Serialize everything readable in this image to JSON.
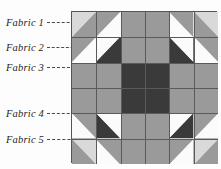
{
  "figure": {
    "kind": "quilt-block-diagram"
  },
  "labels": [
    {
      "id": "fabric-1",
      "text": "Fabric 1",
      "x": 6,
      "y": 17,
      "leader_x": 47,
      "leader_y": 22,
      "leader_w": 52
    },
    {
      "id": "fabric-2",
      "text": "Fabric 2",
      "x": 6,
      "y": 42,
      "leader_x": 47,
      "leader_y": 47,
      "leader_w": 36
    },
    {
      "id": "fabric-3",
      "text": "Fabric 3",
      "x": 6,
      "y": 62,
      "leader_x": 47,
      "leader_y": 67,
      "leader_w": 48
    },
    {
      "id": "fabric-4",
      "text": "Fabric 4",
      "x": 6,
      "y": 108,
      "leader_x": 47,
      "leader_y": 113,
      "leader_w": 72
    },
    {
      "id": "fabric-5",
      "text": "Fabric 5",
      "x": 6,
      "y": 134,
      "leader_x": 47,
      "leader_y": 139,
      "leader_w": 90
    }
  ],
  "palette": {
    "fabric1_light": "#d9d9d9",
    "fabric2_medium": "#9a9a9a",
    "fabric3_white": "#fbfbfb",
    "fabric4_dark": "#3a3a3a",
    "fabric5_mediumgray": "#8e8e8e",
    "seam_line": "#5a5a5a",
    "border": "#555555",
    "text": "#1d1d1d"
  },
  "quilt": {
    "x": 71,
    "y": 11,
    "width": 146,
    "height": 152,
    "columns": 6,
    "rows": 6,
    "cells": [
      {
        "r": 0,
        "c": 0,
        "type": "hst",
        "dir": "tl-br",
        "a": "#d9d9d9",
        "b": "#9a9a9a"
      },
      {
        "r": 0,
        "c": 1,
        "type": "hst",
        "dir": "tl-br",
        "a": "#9a9a9a",
        "b": "#fbfbfb"
      },
      {
        "r": 0,
        "c": 2,
        "type": "solid",
        "a": "#9a9a9a"
      },
      {
        "r": 0,
        "c": 3,
        "type": "solid",
        "a": "#9a9a9a"
      },
      {
        "r": 0,
        "c": 4,
        "type": "hst",
        "dir": "tr-bl",
        "a": "#9a9a9a",
        "b": "#fbfbfb"
      },
      {
        "r": 0,
        "c": 5,
        "type": "hst",
        "dir": "tr-bl",
        "a": "#d9d9d9",
        "b": "#9a9a9a"
      },
      {
        "r": 1,
        "c": 0,
        "type": "hst",
        "dir": "tl-br",
        "a": "#9a9a9a",
        "b": "#fbfbfb"
      },
      {
        "r": 1,
        "c": 1,
        "type": "hst",
        "dir": "tl-br",
        "a": "#fbfbfb",
        "b": "#3a3a3a"
      },
      {
        "r": 1,
        "c": 2,
        "type": "solid",
        "a": "#9a9a9a"
      },
      {
        "r": 1,
        "c": 3,
        "type": "solid",
        "a": "#9a9a9a"
      },
      {
        "r": 1,
        "c": 4,
        "type": "hst",
        "dir": "tr-bl",
        "a": "#fbfbfb",
        "b": "#3a3a3a"
      },
      {
        "r": 1,
        "c": 5,
        "type": "hst",
        "dir": "tr-bl",
        "a": "#9a9a9a",
        "b": "#fbfbfb"
      },
      {
        "r": 2,
        "c": 0,
        "type": "solid",
        "a": "#9a9a9a"
      },
      {
        "r": 2,
        "c": 1,
        "type": "solid",
        "a": "#9a9a9a"
      },
      {
        "r": 2,
        "c": 2,
        "type": "solid",
        "a": "#3a3a3a"
      },
      {
        "r": 2,
        "c": 3,
        "type": "solid",
        "a": "#3a3a3a"
      },
      {
        "r": 2,
        "c": 4,
        "type": "solid",
        "a": "#9a9a9a"
      },
      {
        "r": 2,
        "c": 5,
        "type": "solid",
        "a": "#9a9a9a"
      },
      {
        "r": 3,
        "c": 0,
        "type": "solid",
        "a": "#9a9a9a"
      },
      {
        "r": 3,
        "c": 1,
        "type": "solid",
        "a": "#9a9a9a"
      },
      {
        "r": 3,
        "c": 2,
        "type": "solid",
        "a": "#3a3a3a"
      },
      {
        "r": 3,
        "c": 3,
        "type": "solid",
        "a": "#3a3a3a"
      },
      {
        "r": 3,
        "c": 4,
        "type": "solid",
        "a": "#9a9a9a"
      },
      {
        "r": 3,
        "c": 5,
        "type": "solid",
        "a": "#9a9a9a"
      },
      {
        "r": 4,
        "c": 0,
        "type": "hst",
        "dir": "bl-tr",
        "a": "#fbfbfb",
        "b": "#9a9a9a"
      },
      {
        "r": 4,
        "c": 1,
        "type": "hst",
        "dir": "bl-tr",
        "a": "#3a3a3a",
        "b": "#fbfbfb"
      },
      {
        "r": 4,
        "c": 2,
        "type": "solid",
        "a": "#9a9a9a"
      },
      {
        "r": 4,
        "c": 3,
        "type": "solid",
        "a": "#9a9a9a"
      },
      {
        "r": 4,
        "c": 4,
        "type": "hst",
        "dir": "br-tl",
        "a": "#3a3a3a",
        "b": "#fbfbfb"
      },
      {
        "r": 4,
        "c": 5,
        "type": "hst",
        "dir": "br-tl",
        "a": "#fbfbfb",
        "b": "#9a9a9a"
      },
      {
        "r": 5,
        "c": 0,
        "type": "hst",
        "dir": "bl-tr",
        "a": "#9a9a9a",
        "b": "#d9d9d9"
      },
      {
        "r": 5,
        "c": 1,
        "type": "hst",
        "dir": "bl-tr",
        "a": "#fbfbfb",
        "b": "#9a9a9a"
      },
      {
        "r": 5,
        "c": 2,
        "type": "solid",
        "a": "#9a9a9a"
      },
      {
        "r": 5,
        "c": 3,
        "type": "solid",
        "a": "#9a9a9a"
      },
      {
        "r": 5,
        "c": 4,
        "type": "hst",
        "dir": "br-tl",
        "a": "#fbfbfb",
        "b": "#9a9a9a"
      },
      {
        "r": 5,
        "c": 5,
        "type": "hst",
        "dir": "br-tl",
        "a": "#9a9a9a",
        "b": "#d9d9d9"
      }
    ]
  }
}
